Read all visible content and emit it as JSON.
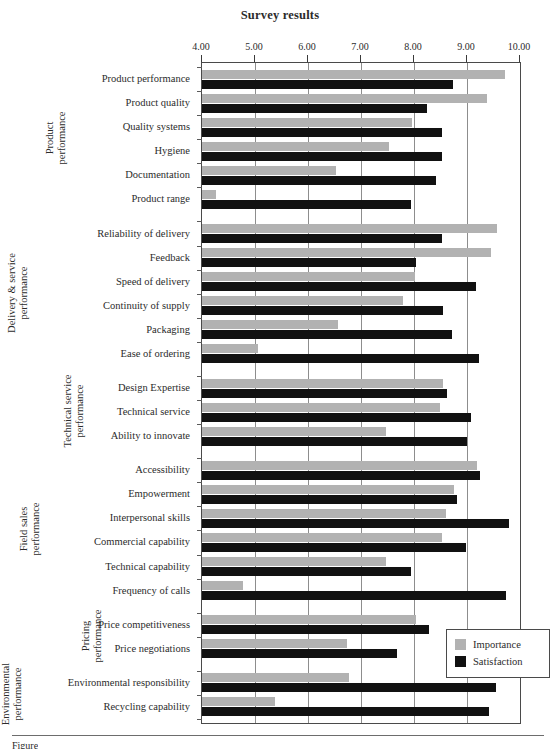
{
  "chart_data": {
    "type": "bar",
    "orientation": "horizontal",
    "title": "Survey results",
    "xlabel": "",
    "ylabel": "",
    "xlim": [
      4.0,
      10.0
    ],
    "xticks": [
      "4.00",
      "5.00",
      "6.00",
      "7.00",
      "8.00",
      "9.00",
      "10.00"
    ],
    "xtick_values": [
      4,
      5,
      6,
      7,
      8,
      9,
      10
    ],
    "grid": true,
    "legend_position": "bottom-right",
    "legend": [
      {
        "name": "Importance",
        "color": "#b2b2b2"
      },
      {
        "name": "Satisfaction",
        "color": "#111111"
      }
    ],
    "series": [
      {
        "name": "Importance",
        "color": "#b2b2b2",
        "values": [
          9.72,
          9.38,
          7.96,
          7.53,
          6.53,
          4.26,
          9.57,
          9.45,
          8.01,
          7.8,
          6.56,
          5.05,
          8.54,
          8.49,
          7.48,
          9.19,
          8.76,
          8.6,
          8.52,
          7.48,
          4.77,
          8.04,
          6.73,
          6.78,
          5.38
        ]
      },
      {
        "name": "Satisfaction",
        "color": "#111111",
        "values": [
          8.73,
          8.24,
          8.52,
          8.53,
          8.42,
          7.94,
          8.53,
          8.04,
          9.17,
          8.54,
          8.72,
          9.23,
          8.62,
          9.08,
          9.0,
          9.25,
          8.82,
          9.79,
          8.98,
          7.94,
          9.74,
          8.29,
          7.68,
          9.55,
          9.42
        ]
      }
    ],
    "categories": [
      "Product performance",
      "Product quality",
      "Quality systems",
      "Hygiene",
      "Documentation",
      "Product range",
      "Reliability of delivery",
      "Feedback",
      "Speed of delivery",
      "Continuity of supply",
      "Packaging",
      "Ease of ordering",
      "Design Expertise",
      "Technical service",
      "Ability to innovate",
      "Accessibility",
      "Empowerment",
      "Interpersonal skills",
      "Commercial capability",
      "Technical capability",
      "Frequency of calls",
      "Price competitiveness",
      "Price negotiations",
      "Environmental responsibility",
      "Recycling capability"
    ],
    "groups": [
      {
        "label": "Product performance",
        "label_lines": [
          "Product",
          "performance"
        ],
        "start": 0,
        "count": 6
      },
      {
        "label": "Delivery & service performance",
        "label_lines": [
          "Delivery & service",
          "performance"
        ],
        "start": 6,
        "count": 6
      },
      {
        "label": "Technical service performance",
        "label_lines": [
          "Technical service",
          "performance"
        ],
        "start": 12,
        "count": 3
      },
      {
        "label": "Field sales performance",
        "label_lines": [
          "Field sales",
          "performance"
        ],
        "start": 15,
        "count": 6
      },
      {
        "label": "Pricing performance",
        "label_lines": [
          "Pricing",
          "performance"
        ],
        "start": 21,
        "count": 2
      },
      {
        "label": "Environmental performance",
        "label_lines": [
          "Environmental",
          "performance"
        ],
        "start": 23,
        "count": 2
      }
    ]
  },
  "caption": {
    "text": "Figure"
  },
  "colors": {
    "importance": "#b2b2b2",
    "satisfaction": "#111111",
    "axis": "#4a4a4a",
    "grid": "#8d8d8d",
    "text": "#2b2b2b"
  }
}
